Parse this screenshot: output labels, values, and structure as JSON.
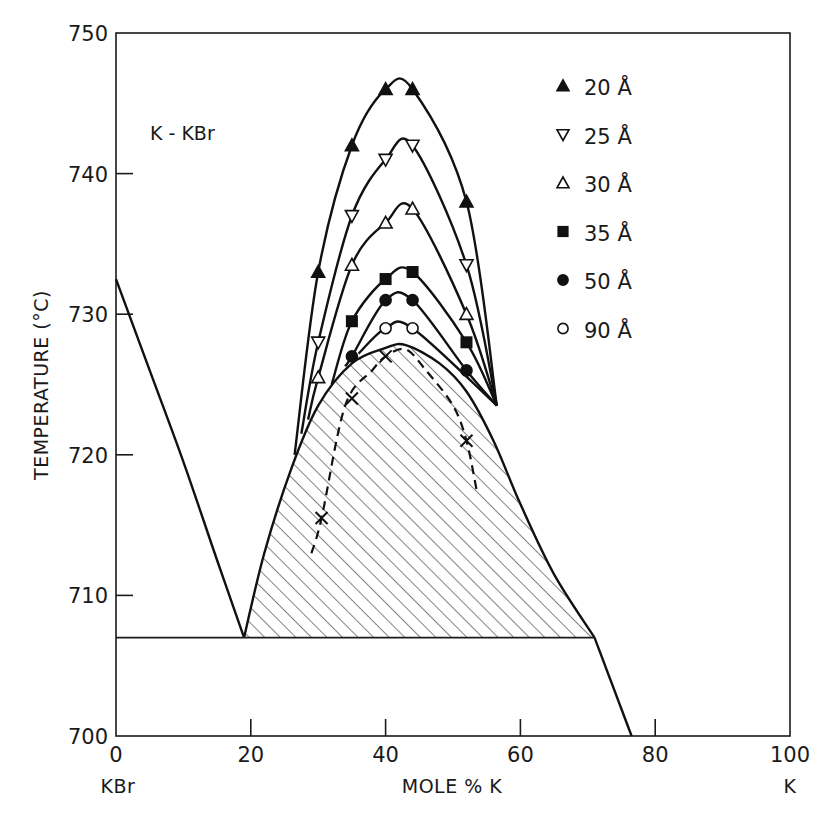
{
  "chart_data": {
    "type": "scatter",
    "title": "K - KBr",
    "xlabel": "MOLE % K",
    "ylabel": "TEMPERATURE (°C)",
    "xlim": [
      0,
      100
    ],
    "ylim": [
      700,
      750
    ],
    "x_ticks": [
      0,
      20,
      40,
      60,
      80,
      100
    ],
    "y_ticks": [
      700,
      710,
      720,
      730,
      740,
      750
    ],
    "x_end_labels": {
      "left": "KBr",
      "right": "K"
    },
    "grid": false,
    "legend_position": "upper right",
    "legend_title_unit": "Å",
    "series": [
      {
        "name": "20 Å",
        "marker": "filled-triangle-up",
        "points": [
          [
            30,
            733
          ],
          [
            35,
            742
          ],
          [
            40,
            746
          ],
          [
            44,
            746
          ],
          [
            52,
            738
          ]
        ]
      },
      {
        "name": "25 Å",
        "marker": "open-triangle-down",
        "points": [
          [
            30,
            728
          ],
          [
            35,
            737
          ],
          [
            40,
            741
          ],
          [
            44,
            742
          ],
          [
            52,
            733.5
          ]
        ]
      },
      {
        "name": "30 Å",
        "marker": "open-triangle-up",
        "points": [
          [
            30,
            725.5
          ],
          [
            35,
            733.5
          ],
          [
            40,
            736.5
          ],
          [
            44,
            737.5
          ],
          [
            52,
            730
          ]
        ]
      },
      {
        "name": "35 Å",
        "marker": "filled-square",
        "points": [
          [
            35,
            729.5
          ],
          [
            40,
            732.5
          ],
          [
            44,
            733
          ],
          [
            52,
            728
          ]
        ]
      },
      {
        "name": "50 Å",
        "marker": "filled-circle",
        "points": [
          [
            35,
            727
          ],
          [
            40,
            731
          ],
          [
            44,
            731
          ],
          [
            52,
            726
          ]
        ]
      },
      {
        "name": "90 Å",
        "marker": "open-circle",
        "points": [
          [
            40,
            729
          ],
          [
            44,
            729
          ]
        ]
      }
    ],
    "phase_boundaries": {
      "liquidus_kbr_side": [
        [
          0,
          732.5
        ],
        [
          5,
          726
        ],
        [
          10,
          719.5
        ],
        [
          15,
          712.5
        ],
        [
          19,
          707
        ]
      ],
      "miscibility_gap_bulk": [
        [
          19,
          707
        ],
        [
          22,
          713
        ],
        [
          26,
          719
        ],
        [
          30,
          723.5
        ],
        [
          35,
          726.5
        ],
        [
          40,
          727.6
        ],
        [
          43,
          727.8
        ],
        [
          48,
          726.5
        ],
        [
          52,
          724.5
        ],
        [
          56,
          721
        ],
        [
          60,
          716.5
        ],
        [
          65,
          711.5
        ],
        [
          71,
          707
        ]
      ],
      "liquidus_k_side": [
        [
          71,
          707
        ],
        [
          76.5,
          700
        ]
      ],
      "monotectic_temperature": 707,
      "monotectic_range": [
        0,
        71
      ],
      "spinodal_dashed": [
        [
          29,
          713
        ],
        [
          30.5,
          715.5
        ],
        [
          34,
          723.5
        ],
        [
          38,
          726
        ],
        [
          40,
          727
        ],
        [
          43,
          727.5
        ],
        [
          46,
          726
        ],
        [
          50,
          723.5
        ],
        [
          52,
          721
        ],
        [
          53.5,
          717.5
        ]
      ],
      "spinodal_markers_x": [
        [
          30.5,
          715.5
        ],
        [
          35,
          724
        ],
        [
          40,
          727
        ],
        [
          52,
          721
        ]
      ]
    },
    "annotations": [
      "hatched two-liquid region below bulk miscibility gap"
    ]
  }
}
